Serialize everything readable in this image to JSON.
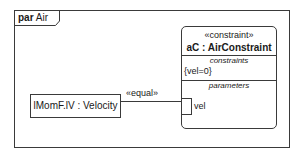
{
  "frame": {
    "kind": "par",
    "name": "Air"
  },
  "constraint_block": {
    "stereotype": "«constraint»",
    "name": "aC : AirConstraint",
    "compartments": {
      "constraints_title": "constraints",
      "constraint_expression": "{vel=0}",
      "parameters_title": "parameters"
    },
    "parameter": {
      "name": "vel"
    }
  },
  "part": {
    "label": "lMomF.lV : Velocity"
  },
  "connector": {
    "label": "«equal»"
  },
  "colors": {
    "line": "#3a3a3a",
    "background": "#ffffff",
    "text": "#1a1a1a"
  }
}
